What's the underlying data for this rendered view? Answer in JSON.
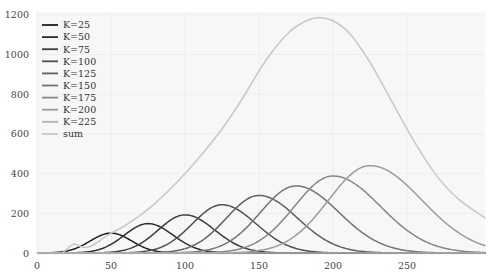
{
  "chart_data": {
    "type": "line",
    "title": "",
    "xlabel": "",
    "ylabel": "",
    "xlim": [
      0,
      303
    ],
    "ylim": [
      0,
      1210
    ],
    "x_ticks": [
      0,
      50,
      100,
      150,
      200,
      250
    ],
    "y_ticks": [
      0,
      200,
      400,
      600,
      800,
      1000,
      1200
    ],
    "grid": true,
    "legend_position": "upper left",
    "series": [
      {
        "name": "K=25",
        "color": "#1e1e1e",
        "peak_x": 50,
        "peak_y": 100,
        "width_l": 14,
        "width_r": 14
      },
      {
        "name": "K=50",
        "color": "#2e2e2e",
        "peak_x": 75,
        "peak_y": 148,
        "width_l": 16,
        "width_r": 17
      },
      {
        "name": "K=75",
        "color": "#3e3e3e",
        "peak_x": 100,
        "peak_y": 192,
        "width_l": 18,
        "width_r": 20
      },
      {
        "name": "K=100",
        "color": "#4f4f4f",
        "peak_x": 125,
        "peak_y": 243,
        "width_l": 20,
        "width_r": 23
      },
      {
        "name": "K=125",
        "color": "#616161",
        "peak_x": 150,
        "peak_y": 290,
        "width_l": 22,
        "width_r": 26
      },
      {
        "name": "K=150",
        "color": "#737373",
        "peak_x": 175,
        "peak_y": 338,
        "width_l": 24,
        "width_r": 29
      },
      {
        "name": "K=175",
        "color": "#878787",
        "peak_x": 200,
        "peak_y": 388,
        "width_l": 26,
        "width_r": 32
      },
      {
        "name": "K=200",
        "color": "#9c9c9c",
        "peak_x": 225,
        "peak_y": 440,
        "width_l": 28,
        "width_r": 35
      },
      {
        "name": "K=225",
        "color": "#b2b2b2",
        "peak_x": 250,
        "peak_y": 0,
        "width_l": 30,
        "width_r": 38
      },
      {
        "name": "sum",
        "color": "#c8c8c8",
        "points": [
          [
            17,
            0
          ],
          [
            20,
            18
          ],
          [
            25,
            45
          ],
          [
            30,
            32
          ],
          [
            35,
            30
          ],
          [
            42,
            60
          ],
          [
            50,
            100
          ],
          [
            60,
            140
          ],
          [
            77,
            232
          ],
          [
            95,
            360
          ],
          [
            110,
            485
          ],
          [
            125,
            625
          ],
          [
            137,
            757
          ],
          [
            155,
            975
          ],
          [
            170,
            1110
          ],
          [
            182,
            1170
          ],
          [
            190,
            1185
          ],
          [
            200,
            1170
          ],
          [
            212,
            1100
          ],
          [
            225,
            960
          ],
          [
            240,
            760
          ],
          [
            255,
            560
          ],
          [
            270,
            390
          ],
          [
            285,
            270
          ],
          [
            303,
            176
          ]
        ]
      }
    ]
  },
  "legend": {
    "items": [
      "K=25",
      "K=50",
      "K=75",
      "K=100",
      "K=125",
      "K=150",
      "K=175",
      "K=200",
      "K=225",
      "sum"
    ]
  },
  "axes": {
    "x_tick_labels": [
      "0",
      "50",
      "100",
      "150",
      "200",
      "250"
    ],
    "y_tick_labels": [
      "0",
      "200",
      "400",
      "600",
      "800",
      "1000",
      "1200"
    ]
  }
}
